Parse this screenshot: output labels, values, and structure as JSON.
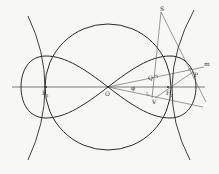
{
  "diagram": {
    "labels": {
      "F1": "F",
      "F1_sub": "1",
      "F2": "F",
      "F2_sub": "2",
      "O": "O",
      "Q": "Q",
      "V": "V",
      "P": "P",
      "S": "S",
      "m": "m",
      "phi": "φ"
    },
    "colors": {
      "curve": "#2a2a2a",
      "line": "#555555",
      "background": "#f7f7f5"
    }
  }
}
